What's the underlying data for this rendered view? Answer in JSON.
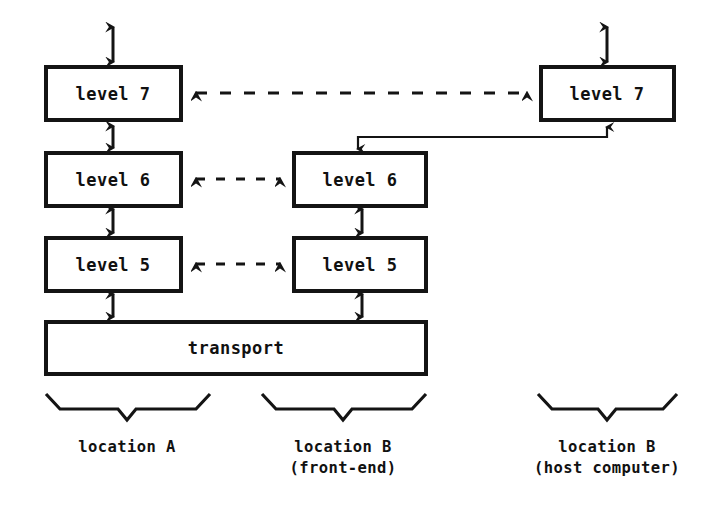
{
  "diagram": {
    "background_color": "#ffffff",
    "line_color": "#141414",
    "nodes": [
      {
        "id": "a-level7",
        "label": "level 7",
        "column": "location A"
      },
      {
        "id": "a-level6",
        "label": "level 6",
        "column": "location A"
      },
      {
        "id": "a-level5",
        "label": "level 5",
        "column": "location A"
      },
      {
        "id": "transport",
        "label": "transport",
        "column": "location A"
      },
      {
        "id": "b-level6",
        "label": "level 6",
        "column": "location B (front-end)"
      },
      {
        "id": "b-level5",
        "label": "level 5",
        "column": "location B (front-end)"
      },
      {
        "id": "h-level7",
        "label": "level 7",
        "column": "location B (host computer)"
      }
    ],
    "connections": [
      {
        "from": "a-level7",
        "to": "h-level7",
        "style": "dashed",
        "direction": "bidirectional"
      },
      {
        "from": "a-level6",
        "to": "b-level6",
        "style": "dashed",
        "direction": "bidirectional"
      },
      {
        "from": "a-level5",
        "to": "b-level5",
        "style": "dashed",
        "direction": "bidirectional"
      },
      {
        "from": "a-level7",
        "to": "a-level6",
        "style": "solid",
        "direction": "bidirectional"
      },
      {
        "from": "a-level6",
        "to": "a-level5",
        "style": "solid",
        "direction": "bidirectional"
      },
      {
        "from": "a-level5",
        "to": "transport",
        "style": "solid",
        "direction": "bidirectional"
      },
      {
        "from": "b-level6",
        "to": "b-level5",
        "style": "solid",
        "direction": "bidirectional"
      },
      {
        "from": "b-level5",
        "to": "transport",
        "style": "solid",
        "direction": "bidirectional"
      },
      {
        "from": "b-level6",
        "to": "h-level7",
        "style": "solid",
        "direction": "bidirectional"
      },
      {
        "from": "a-level7",
        "to": "above",
        "style": "solid",
        "direction": "bidirectional"
      },
      {
        "from": "h-level7",
        "to": "above",
        "style": "solid",
        "direction": "bidirectional"
      }
    ],
    "captions": [
      {
        "id": "caption-a",
        "line1": "location A",
        "line2": ""
      },
      {
        "id": "caption-b",
        "line1": "location B",
        "line2": "(front-end)"
      },
      {
        "id": "caption-host",
        "line1": "location B",
        "line2": "(host computer)"
      }
    ]
  }
}
